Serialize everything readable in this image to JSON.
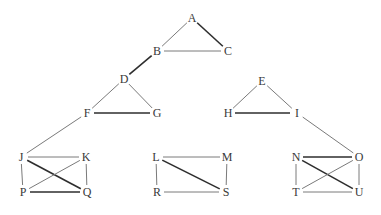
{
  "diagram": {
    "type": "graph",
    "nodes": [
      {
        "id": "A",
        "label": "A",
        "x": 192,
        "y": 18
      },
      {
        "id": "B",
        "label": "B",
        "x": 157,
        "y": 51
      },
      {
        "id": "C",
        "label": "C",
        "x": 228,
        "y": 51
      },
      {
        "id": "D",
        "label": "D",
        "x": 124,
        "y": 79
      },
      {
        "id": "E",
        "label": "E",
        "x": 262,
        "y": 81
      },
      {
        "id": "F",
        "label": "F",
        "x": 87,
        "y": 113
      },
      {
        "id": "G",
        "label": "G",
        "x": 157,
        "y": 113
      },
      {
        "id": "H",
        "label": "H",
        "x": 228,
        "y": 113
      },
      {
        "id": "I",
        "label": "I",
        "x": 297,
        "y": 113
      },
      {
        "id": "J",
        "label": "J",
        "x": 21,
        "y": 157
      },
      {
        "id": "K",
        "label": "K",
        "x": 86,
        "y": 157
      },
      {
        "id": "P",
        "label": "P",
        "x": 23,
        "y": 192
      },
      {
        "id": "Q",
        "label": "Q",
        "x": 87,
        "y": 192
      },
      {
        "id": "L",
        "label": "L",
        "x": 156,
        "y": 157
      },
      {
        "id": "M",
        "label": "M",
        "x": 227,
        "y": 157
      },
      {
        "id": "R",
        "label": "R",
        "x": 157,
        "y": 192
      },
      {
        "id": "S",
        "label": "S",
        "x": 226,
        "y": 192
      },
      {
        "id": "N",
        "label": "N",
        "x": 296,
        "y": 157
      },
      {
        "id": "O",
        "label": "O",
        "x": 359,
        "y": 157
      },
      {
        "id": "T",
        "label": "T",
        "x": 296,
        "y": 192
      },
      {
        "id": "U",
        "label": "U",
        "x": 359,
        "y": 192
      }
    ],
    "edges": [
      {
        "from": "A",
        "to": "B",
        "bold": false
      },
      {
        "from": "A",
        "to": "C",
        "bold": true
      },
      {
        "from": "B",
        "to": "C",
        "bold": false
      },
      {
        "from": "B",
        "to": "D",
        "bold": true
      },
      {
        "from": "D",
        "to": "F",
        "bold": false
      },
      {
        "from": "D",
        "to": "G",
        "bold": false
      },
      {
        "from": "F",
        "to": "G",
        "bold": true
      },
      {
        "from": "F",
        "to": "J",
        "bold": false
      },
      {
        "from": "E",
        "to": "H",
        "bold": false
      },
      {
        "from": "E",
        "to": "I",
        "bold": false
      },
      {
        "from": "H",
        "to": "I",
        "bold": true
      },
      {
        "from": "I",
        "to": "O",
        "bold": false
      },
      {
        "from": "J",
        "to": "K",
        "bold": false
      },
      {
        "from": "J",
        "to": "P",
        "bold": false
      },
      {
        "from": "J",
        "to": "Q",
        "bold": true
      },
      {
        "from": "K",
        "to": "P",
        "bold": false
      },
      {
        "from": "K",
        "to": "Q",
        "bold": false
      },
      {
        "from": "P",
        "to": "Q",
        "bold": true
      },
      {
        "from": "L",
        "to": "M",
        "bold": false
      },
      {
        "from": "L",
        "to": "R",
        "bold": false
      },
      {
        "from": "L",
        "to": "S",
        "bold": true
      },
      {
        "from": "M",
        "to": "S",
        "bold": false
      },
      {
        "from": "R",
        "to": "S",
        "bold": false
      },
      {
        "from": "N",
        "to": "O",
        "bold": true
      },
      {
        "from": "N",
        "to": "T",
        "bold": false
      },
      {
        "from": "N",
        "to": "U",
        "bold": true
      },
      {
        "from": "O",
        "to": "T",
        "bold": false
      },
      {
        "from": "O",
        "to": "U",
        "bold": false
      },
      {
        "from": "T",
        "to": "U",
        "bold": false
      }
    ],
    "colors": {
      "edge": "#7a7a7a",
      "edge_bold": "#2e2e2e",
      "label": "#3a3a3a",
      "background": "#ffffff"
    }
  }
}
